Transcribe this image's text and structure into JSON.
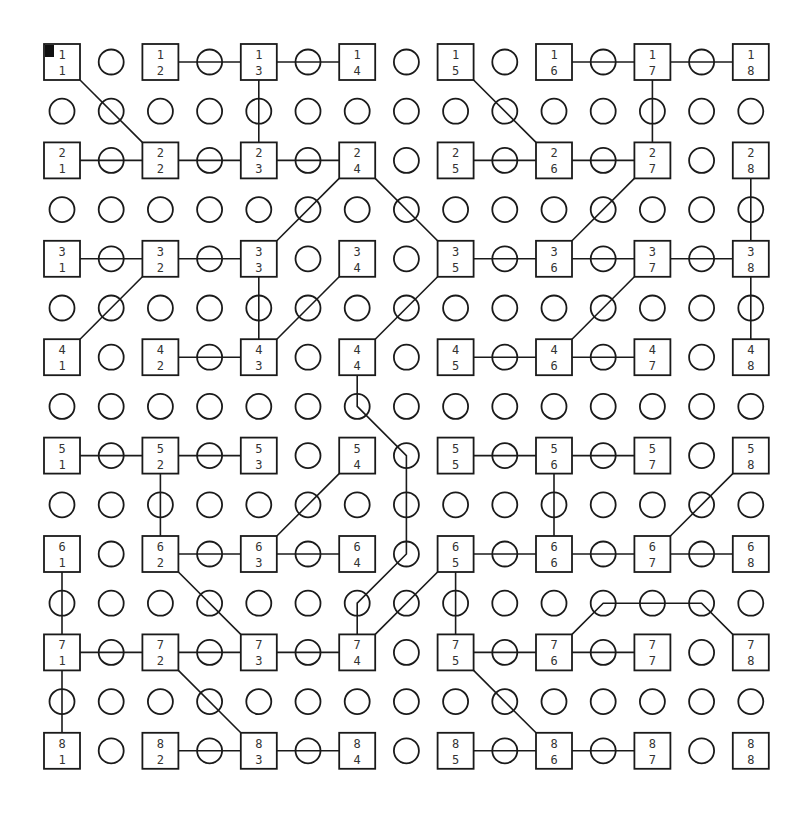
{
  "diagram": {
    "type": "grid-network",
    "grid_size": 8,
    "cursor": {
      "row": 1,
      "col": 1
    },
    "colors": {
      "stroke": "#1a1a1a",
      "background": "#ffffff",
      "cursor": "#111111",
      "label": "#333333"
    },
    "nodes": [
      {
        "id": "1-1",
        "row": 1,
        "col": 1,
        "label_top": "1",
        "label_bottom": "1"
      },
      {
        "id": "1-2",
        "row": 1,
        "col": 2,
        "label_top": "1",
        "label_bottom": "2"
      },
      {
        "id": "1-3",
        "row": 1,
        "col": 3,
        "label_top": "1",
        "label_bottom": "3"
      },
      {
        "id": "1-4",
        "row": 1,
        "col": 4,
        "label_top": "1",
        "label_bottom": "4"
      },
      {
        "id": "1-5",
        "row": 1,
        "col": 5,
        "label_top": "1",
        "label_bottom": "5"
      },
      {
        "id": "1-6",
        "row": 1,
        "col": 6,
        "label_top": "1",
        "label_bottom": "6"
      },
      {
        "id": "1-7",
        "row": 1,
        "col": 7,
        "label_top": "1",
        "label_bottom": "7"
      },
      {
        "id": "1-8",
        "row": 1,
        "col": 8,
        "label_top": "1",
        "label_bottom": "8"
      },
      {
        "id": "2-1",
        "row": 2,
        "col": 1,
        "label_top": "2",
        "label_bottom": "1"
      },
      {
        "id": "2-2",
        "row": 2,
        "col": 2,
        "label_top": "2",
        "label_bottom": "2"
      },
      {
        "id": "2-3",
        "row": 2,
        "col": 3,
        "label_top": "2",
        "label_bottom": "3"
      },
      {
        "id": "2-4",
        "row": 2,
        "col": 4,
        "label_top": "2",
        "label_bottom": "4"
      },
      {
        "id": "2-5",
        "row": 2,
        "col": 5,
        "label_top": "2",
        "label_bottom": "5"
      },
      {
        "id": "2-6",
        "row": 2,
        "col": 6,
        "label_top": "2",
        "label_bottom": "6"
      },
      {
        "id": "2-7",
        "row": 2,
        "col": 7,
        "label_top": "2",
        "label_bottom": "7"
      },
      {
        "id": "2-8",
        "row": 2,
        "col": 8,
        "label_top": "2",
        "label_bottom": "8"
      },
      {
        "id": "3-1",
        "row": 3,
        "col": 1,
        "label_top": "3",
        "label_bottom": "1"
      },
      {
        "id": "3-2",
        "row": 3,
        "col": 2,
        "label_top": "3",
        "label_bottom": "2"
      },
      {
        "id": "3-3",
        "row": 3,
        "col": 3,
        "label_top": "3",
        "label_bottom": "3"
      },
      {
        "id": "3-4",
        "row": 3,
        "col": 4,
        "label_top": "3",
        "label_bottom": "4"
      },
      {
        "id": "3-5",
        "row": 3,
        "col": 5,
        "label_top": "3",
        "label_bottom": "5"
      },
      {
        "id": "3-6",
        "row": 3,
        "col": 6,
        "label_top": "3",
        "label_bottom": "6"
      },
      {
        "id": "3-7",
        "row": 3,
        "col": 7,
        "label_top": "3",
        "label_bottom": "7"
      },
      {
        "id": "3-8",
        "row": 3,
        "col": 8,
        "label_top": "3",
        "label_bottom": "8"
      },
      {
        "id": "4-1",
        "row": 4,
        "col": 1,
        "label_top": "4",
        "label_bottom": "1"
      },
      {
        "id": "4-2",
        "row": 4,
        "col": 2,
        "label_top": "4",
        "label_bottom": "2"
      },
      {
        "id": "4-3",
        "row": 4,
        "col": 3,
        "label_top": "4",
        "label_bottom": "3"
      },
      {
        "id": "4-4",
        "row": 4,
        "col": 4,
        "label_top": "4",
        "label_bottom": "4"
      },
      {
        "id": "4-5",
        "row": 4,
        "col": 5,
        "label_top": "4",
        "label_bottom": "5"
      },
      {
        "id": "4-6",
        "row": 4,
        "col": 6,
        "label_top": "4",
        "label_bottom": "6"
      },
      {
        "id": "4-7",
        "row": 4,
        "col": 7,
        "label_top": "4",
        "label_bottom": "7"
      },
      {
        "id": "4-8",
        "row": 4,
        "col": 8,
        "label_top": "4",
        "label_bottom": "8"
      },
      {
        "id": "5-1",
        "row": 5,
        "col": 1,
        "label_top": "5",
        "label_bottom": "1"
      },
      {
        "id": "5-2",
        "row": 5,
        "col": 2,
        "label_top": "5",
        "label_bottom": "2"
      },
      {
        "id": "5-3",
        "row": 5,
        "col": 3,
        "label_top": "5",
        "label_bottom": "3"
      },
      {
        "id": "5-4",
        "row": 5,
        "col": 4,
        "label_top": "5",
        "label_bottom": "4"
      },
      {
        "id": "5-5",
        "row": 5,
        "col": 5,
        "label_top": "5",
        "label_bottom": "5"
      },
      {
        "id": "5-6",
        "row": 5,
        "col": 6,
        "label_top": "5",
        "label_bottom": "6"
      },
      {
        "id": "5-7",
        "row": 5,
        "col": 7,
        "label_top": "5",
        "label_bottom": "7"
      },
      {
        "id": "5-8",
        "row": 5,
        "col": 8,
        "label_top": "5",
        "label_bottom": "8"
      },
      {
        "id": "6-1",
        "row": 6,
        "col": 1,
        "label_top": "6",
        "label_bottom": "1"
      },
      {
        "id": "6-2",
        "row": 6,
        "col": 2,
        "label_top": "6",
        "label_bottom": "2"
      },
      {
        "id": "6-3",
        "row": 6,
        "col": 3,
        "label_top": "6",
        "label_bottom": "3"
      },
      {
        "id": "6-4",
        "row": 6,
        "col": 4,
        "label_top": "6",
        "label_bottom": "4"
      },
      {
        "id": "6-5",
        "row": 6,
        "col": 5,
        "label_top": "6",
        "label_bottom": "5"
      },
      {
        "id": "6-6",
        "row": 6,
        "col": 6,
        "label_top": "6",
        "label_bottom": "6"
      },
      {
        "id": "6-7",
        "row": 6,
        "col": 7,
        "label_top": "6",
        "label_bottom": "7"
      },
      {
        "id": "6-8",
        "row": 6,
        "col": 8,
        "label_top": "6",
        "label_bottom": "8"
      },
      {
        "id": "7-1",
        "row": 7,
        "col": 1,
        "label_top": "7",
        "label_bottom": "1"
      },
      {
        "id": "7-2",
        "row": 7,
        "col": 2,
        "label_top": "7",
        "label_bottom": "2"
      },
      {
        "id": "7-3",
        "row": 7,
        "col": 3,
        "label_top": "7",
        "label_bottom": "3"
      },
      {
        "id": "7-4",
        "row": 7,
        "col": 4,
        "label_top": "7",
        "label_bottom": "4"
      },
      {
        "id": "7-5",
        "row": 7,
        "col": 5,
        "label_top": "7",
        "label_bottom": "5"
      },
      {
        "id": "7-6",
        "row": 7,
        "col": 6,
        "label_top": "7",
        "label_bottom": "6"
      },
      {
        "id": "7-7",
        "row": 7,
        "col": 7,
        "label_top": "7",
        "label_bottom": "7"
      },
      {
        "id": "7-8",
        "row": 7,
        "col": 8,
        "label_top": "7",
        "label_bottom": "8"
      },
      {
        "id": "8-1",
        "row": 8,
        "col": 1,
        "label_top": "8",
        "label_bottom": "1"
      },
      {
        "id": "8-2",
        "row": 8,
        "col": 2,
        "label_top": "8",
        "label_bottom": "2"
      },
      {
        "id": "8-3",
        "row": 8,
        "col": 3,
        "label_top": "8",
        "label_bottom": "3"
      },
      {
        "id": "8-4",
        "row": 8,
        "col": 4,
        "label_top": "8",
        "label_bottom": "4"
      },
      {
        "id": "8-5",
        "row": 8,
        "col": 5,
        "label_top": "8",
        "label_bottom": "5"
      },
      {
        "id": "8-6",
        "row": 8,
        "col": 6,
        "label_top": "8",
        "label_bottom": "6"
      },
      {
        "id": "8-7",
        "row": 8,
        "col": 7,
        "label_top": "8",
        "label_bottom": "7"
      },
      {
        "id": "8-8",
        "row": 8,
        "col": 8,
        "label_top": "8",
        "label_bottom": "8"
      }
    ],
    "connections": [
      {
        "path": [
          [
            1,
            2
          ],
          [
            1,
            3
          ]
        ]
      },
      {
        "path": [
          [
            1,
            3
          ],
          [
            1,
            4
          ]
        ]
      },
      {
        "path": [
          [
            1,
            6
          ],
          [
            1,
            7
          ]
        ]
      },
      {
        "path": [
          [
            1,
            7
          ],
          [
            1,
            8
          ]
        ]
      },
      {
        "path": [
          [
            1,
            1
          ],
          [
            2,
            2
          ]
        ]
      },
      {
        "path": [
          [
            1,
            3
          ],
          [
            2,
            3
          ]
        ]
      },
      {
        "path": [
          [
            1,
            5
          ],
          [
            2,
            6
          ]
        ]
      },
      {
        "path": [
          [
            1,
            7
          ],
          [
            2,
            7
          ]
        ]
      },
      {
        "path": [
          [
            2,
            1
          ],
          [
            2,
            2
          ]
        ]
      },
      {
        "path": [
          [
            2,
            2
          ],
          [
            2,
            3
          ]
        ]
      },
      {
        "path": [
          [
            2,
            3
          ],
          [
            2,
            4
          ]
        ]
      },
      {
        "path": [
          [
            2,
            5
          ],
          [
            2,
            6
          ]
        ]
      },
      {
        "path": [
          [
            2,
            6
          ],
          [
            2,
            7
          ]
        ]
      },
      {
        "path": [
          [
            2,
            4
          ],
          [
            3,
            3
          ]
        ]
      },
      {
        "path": [
          [
            2,
            4
          ],
          [
            3,
            5
          ]
        ]
      },
      {
        "path": [
          [
            2,
            7
          ],
          [
            3,
            6
          ]
        ]
      },
      {
        "path": [
          [
            2,
            8
          ],
          [
            3,
            8
          ]
        ]
      },
      {
        "path": [
          [
            3,
            1
          ],
          [
            3,
            2
          ]
        ]
      },
      {
        "path": [
          [
            3,
            2
          ],
          [
            3,
            3
          ]
        ]
      },
      {
        "path": [
          [
            3,
            5
          ],
          [
            3,
            6
          ]
        ]
      },
      {
        "path": [
          [
            3,
            6
          ],
          [
            3,
            7
          ]
        ]
      },
      {
        "path": [
          [
            3,
            7
          ],
          [
            3,
            8
          ]
        ]
      },
      {
        "path": [
          [
            3,
            2
          ],
          [
            4,
            1
          ]
        ]
      },
      {
        "path": [
          [
            3,
            3
          ],
          [
            4,
            3
          ]
        ]
      },
      {
        "path": [
          [
            3,
            4
          ],
          [
            4,
            3
          ]
        ]
      },
      {
        "path": [
          [
            3,
            5
          ],
          [
            4,
            4
          ]
        ]
      },
      {
        "path": [
          [
            3,
            7
          ],
          [
            4,
            6
          ]
        ]
      },
      {
        "path": [
          [
            3,
            8
          ],
          [
            4,
            8
          ]
        ]
      },
      {
        "path": [
          [
            4,
            2
          ],
          [
            4,
            3
          ]
        ]
      },
      {
        "path": [
          [
            4,
            5
          ],
          [
            4,
            6
          ]
        ]
      },
      {
        "path": [
          [
            4,
            6
          ],
          [
            4,
            7
          ]
        ]
      },
      {
        "path": [
          [
            4,
            4
          ],
          [
            4.5,
            4
          ],
          [
            5,
            4.5
          ],
          [
            6,
            4.5
          ],
          [
            6.5,
            4
          ],
          [
            7,
            4
          ]
        ]
      },
      {
        "path": [
          [
            5,
            1
          ],
          [
            5,
            2
          ]
        ]
      },
      {
        "path": [
          [
            5,
            2
          ],
          [
            5,
            3
          ]
        ]
      },
      {
        "path": [
          [
            5,
            5
          ],
          [
            5,
            6
          ]
        ]
      },
      {
        "path": [
          [
            5,
            6
          ],
          [
            5,
            7
          ]
        ]
      },
      {
        "path": [
          [
            5,
            2
          ],
          [
            6,
            2
          ]
        ]
      },
      {
        "path": [
          [
            5,
            4
          ],
          [
            6,
            3
          ]
        ]
      },
      {
        "path": [
          [
            5,
            6
          ],
          [
            6,
            6
          ]
        ]
      },
      {
        "path": [
          [
            5,
            8
          ],
          [
            6,
            7
          ]
        ]
      },
      {
        "path": [
          [
            6,
            2
          ],
          [
            6,
            3
          ]
        ]
      },
      {
        "path": [
          [
            6,
            3
          ],
          [
            6,
            4
          ]
        ]
      },
      {
        "path": [
          [
            6,
            5
          ],
          [
            6,
            6
          ]
        ]
      },
      {
        "path": [
          [
            6,
            6
          ],
          [
            6,
            7
          ]
        ]
      },
      {
        "path": [
          [
            6,
            7
          ],
          [
            6,
            8
          ]
        ]
      },
      {
        "path": [
          [
            6,
            1
          ],
          [
            7,
            1
          ]
        ]
      },
      {
        "path": [
          [
            6,
            2
          ],
          [
            7,
            3
          ]
        ]
      },
      {
        "path": [
          [
            6,
            5
          ],
          [
            7,
            4
          ]
        ]
      },
      {
        "path": [
          [
            6,
            5
          ],
          [
            7,
            5
          ]
        ]
      },
      {
        "path": [
          [
            7,
            6
          ],
          [
            6.5,
            6.5
          ],
          [
            6.5,
            7.5
          ],
          [
            7,
            8
          ]
        ]
      },
      {
        "path": [
          [
            7,
            1
          ],
          [
            7,
            2
          ]
        ]
      },
      {
        "path": [
          [
            7,
            2
          ],
          [
            7,
            3
          ]
        ]
      },
      {
        "path": [
          [
            7,
            3
          ],
          [
            7,
            4
          ]
        ]
      },
      {
        "path": [
          [
            7,
            5
          ],
          [
            7,
            6
          ]
        ]
      },
      {
        "path": [
          [
            7,
            6
          ],
          [
            7,
            7
          ]
        ]
      },
      {
        "path": [
          [
            7,
            1
          ],
          [
            8,
            1
          ]
        ]
      },
      {
        "path": [
          [
            7,
            2
          ],
          [
            8,
            3
          ]
        ]
      },
      {
        "path": [
          [
            7,
            5
          ],
          [
            8,
            6
          ]
        ]
      },
      {
        "path": [
          [
            8,
            2
          ],
          [
            8,
            3
          ]
        ]
      },
      {
        "path": [
          [
            8,
            3
          ],
          [
            8,
            4
          ]
        ]
      },
      {
        "path": [
          [
            8,
            5
          ],
          [
            8,
            6
          ]
        ]
      },
      {
        "path": [
          [
            8,
            6
          ],
          [
            8,
            7
          ]
        ]
      }
    ]
  }
}
